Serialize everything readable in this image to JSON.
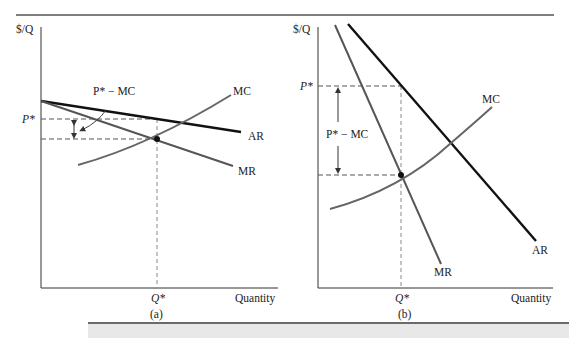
{
  "figure": {
    "top_rule": true,
    "colors": {
      "axis": "#333333",
      "ar_curve": "#111111",
      "mr_curve": "#555555",
      "mc_curve": "#666666",
      "guide_dashed": "#555555",
      "bottom_band": "#e8e8e8"
    }
  },
  "panels": [
    {
      "id": "a",
      "caption": "(a)",
      "y_axis_label": "$/Q",
      "x_axis_label": "Quantity",
      "price_label": "P*",
      "quantity_label": "Q*",
      "markup_label": "P* − MC",
      "curves": {
        "ar": "AR",
        "mr": "MR",
        "mc": "MC"
      }
    },
    {
      "id": "b",
      "caption": "(b)",
      "y_axis_label": "$/Q",
      "x_axis_label": "Quantity",
      "price_label": "P*",
      "quantity_label": "Q*",
      "markup_label": "P* − MC",
      "curves": {
        "ar": "AR",
        "mr": "MR",
        "mc": "MC"
      }
    }
  ]
}
